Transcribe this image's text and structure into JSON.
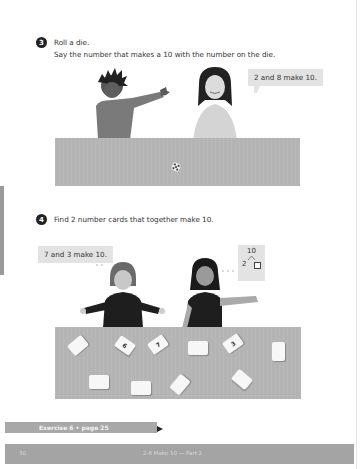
{
  "page": {
    "number": "30",
    "footer_title": "2-6 Make 10 — Part 2"
  },
  "task3": {
    "number": "3",
    "line1": "Roll a die.",
    "line2": "Say the number that makes a 10 with the number on the die.",
    "speech_bubble": "2 and 8 make 10.",
    "die_icon": "die-icon"
  },
  "task4": {
    "number": "4",
    "line1": "Find 2 number cards that together make 10.",
    "speech_bubble_left": "7 and 3 make 10.",
    "number_bond": {
      "whole": "10",
      "part_known": "2",
      "part_unknown": "□"
    },
    "cards": [
      {
        "label": "",
        "face": "down"
      },
      {
        "label": "6",
        "face": "up"
      },
      {
        "label": "7",
        "face": "up"
      },
      {
        "label": "",
        "face": "down"
      },
      {
        "label": "3",
        "face": "up"
      },
      {
        "label": "",
        "face": "down"
      },
      {
        "label": "",
        "face": "down"
      },
      {
        "label": "",
        "face": "down"
      },
      {
        "label": "",
        "face": "down"
      },
      {
        "label": "",
        "face": "down"
      }
    ]
  },
  "exercise_link": {
    "label": "Exercise 6 • page 25"
  },
  "colors": {
    "table": "#b4b4b4",
    "bubble": "#e3e3e3",
    "footer": "#a4a4a4",
    "exercise_bar": "#a8a8a8"
  }
}
